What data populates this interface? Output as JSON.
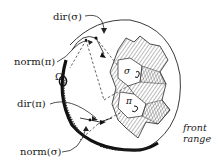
{
  "diagram": {
    "labels": {
      "dir_sigma": "dir(σ)",
      "norm_pi": "norm(π)",
      "omega": "Ω",
      "omega_sub": "3",
      "dir_pi": "dir(π)",
      "norm_sigma": "norm(σ)",
      "front": "front",
      "range": "range",
      "sigma_face": "σ",
      "pi_face": "π"
    },
    "colors": {
      "ink": "#1a1a1a",
      "background": "#ffffff",
      "hatch": "#555555"
    }
  }
}
